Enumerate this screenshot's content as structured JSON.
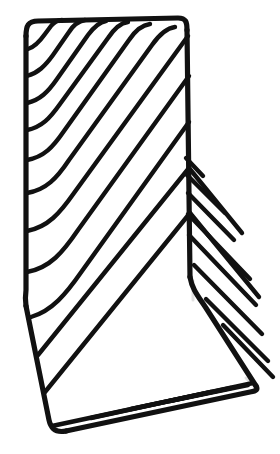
{
  "image": {
    "subject": "wire mesh bookend rack",
    "alt_text": "Black powder-coated wire bookend with diagonal wires, photographed against a plain white background",
    "background_color": "#ffffff",
    "wire_color": "#111111",
    "shadow_color": "#c9c9c9",
    "canvas": {
      "width": 280,
      "height": 454
    }
  },
  "object": {
    "name": "wire-rack",
    "material_finish": "matte black",
    "parts": [
      {
        "name": "back-panel",
        "label": "Back panel"
      },
      {
        "name": "base-panel",
        "label": "Base panel"
      },
      {
        "name": "prongs",
        "label": "Extending wire prongs"
      }
    ],
    "frame_outline": "M 28,38 L 28,296 L 60,430 L 255,388 L 190,278 L 185,23 Z",
    "counts": {
      "back_panel_wires": 11,
      "base_prongs": 8
    }
  },
  "geometry": {
    "frame_segments": [
      {
        "name": "top-edge",
        "d": "M 26,36 C 26,26 28,21 38,21 L 178,18 C 186,18 187,22 187,30"
      },
      {
        "name": "right-edge-upper",
        "d": "M 187,30 L 190,277"
      },
      {
        "name": "right-edge-diagonal",
        "d": "M 190,277 C 192,289 198,296 206,308 L 256,386"
      },
      {
        "name": "bottom-edge",
        "d": "M 256,386 C 258,389 257,391 250,392 L 66,431"
      },
      {
        "name": "bottom-left-corner",
        "d": "M 66,431 C 56,433 51,429 49,420 L 26,306"
      },
      {
        "name": "left-edge",
        "d": "M 26,306 C 25,299 25,297 26,290 L 26,36"
      }
    ],
    "back_panel_wires": [
      {
        "id": 1,
        "d": "M 27,130 C 42,127 50,118 60,104 L 108,38 C 114,29 120,23 128,22"
      },
      {
        "id": 2,
        "d": "M 27,103 C 40,100 48,92 57,79 L 88,35 C 94,27 99,22 106,21"
      },
      {
        "id": 3,
        "d": "M 27,76 C 38,73 45,66 53,55 L 69,32 C 74,24 79,21 85,20"
      },
      {
        "id": 4,
        "d": "M 28,49 C 35,47 40,41 45,34 L 51,26 C 55,21 58,20 62,20"
      },
      {
        "id": 5,
        "d": "M 27,160 C 44,157 53,147 64,131 L 129,40 C 135,31 142,25 150,24"
      },
      {
        "id": 6,
        "d": "M 27,193 C 46,190 57,178 69,160 L 152,45 C 159,35 167,28 175,27"
      },
      {
        "id": 7,
        "d": "M 27,231 C 48,227 60,213 74,193 L 188,36"
      },
      {
        "id": 8,
        "d": "M 27,272 C 50,268 63,252 78,230 L 189,76"
      },
      {
        "id": 9,
        "d": "M 31,317 C 52,311 66,294 82,271 L 189,122"
      },
      {
        "id": 10,
        "d": "M 38,355 L 189,168"
      },
      {
        "id": 11,
        "d": "M 45,392 L 190,213"
      }
    ],
    "base_wires": [
      {
        "id": 1,
        "d": "M 189,168 L 242,233"
      },
      {
        "id": 2,
        "d": "M 190,213 L 259,297"
      },
      {
        "id": 3,
        "d": "M 52,426 L 253,383"
      },
      {
        "id": 4,
        "d": "M 91,418 L 211,392"
      },
      {
        "id": 5,
        "d": "M 131,409 L 231,388"
      },
      {
        "id": 6,
        "d": "M 170,401 L 248,385"
      }
    ],
    "prongs": [
      {
        "id": 1,
        "d": "M 186,158 L 203,176",
        "tip": [
          203,
          176
        ]
      },
      {
        "id": 2,
        "d": "M 187,175 L 225,213",
        "tip": [
          225,
          213
        ]
      },
      {
        "id": 3,
        "d": "M 188,193 L 234,240",
        "tip": [
          234,
          240
        ]
      },
      {
        "id": 4,
        "d": "M 188,214 L 250,279",
        "tip": [
          250,
          279
        ]
      },
      {
        "id": 5,
        "d": "M 189,235 L 256,305",
        "tip": [
          256,
          305
        ]
      },
      {
        "id": 6,
        "d": "M 194,265 L 262,334",
        "tip": [
          262,
          334
        ]
      },
      {
        "id": 7,
        "d": "M 206,299 L 268,361",
        "tip": [
          268,
          361
        ]
      },
      {
        "id": 8,
        "d": "M 223,325 L 273,377",
        "tip": [
          273,
          377
        ]
      }
    ],
    "shadow_strokes": [
      {
        "d": "M 193,281 L 193,300"
      },
      {
        "d": "M 246,378 L 258,390"
      }
    ]
  }
}
